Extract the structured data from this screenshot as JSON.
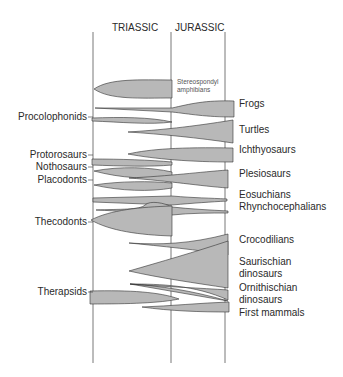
{
  "periods": [
    {
      "label": "TRIASSIC",
      "x": 112
    },
    {
      "label": "JURASSIC",
      "x": 175
    }
  ],
  "timelines": [
    93,
    171,
    225
  ],
  "colors": {
    "fill": "#b8b8b8",
    "stroke": "#333333",
    "line": "#555555"
  },
  "left_labels": [
    {
      "label": "Procolophonids",
      "y": 117
    },
    {
      "label": "Protorosaurs",
      "y": 155
    },
    {
      "label": "Nothosaurs",
      "y": 167
    },
    {
      "label": "Placodonts",
      "y": 180
    },
    {
      "label": "Thecodonts",
      "y": 222
    },
    {
      "label": "Therapsids",
      "y": 292
    }
  ],
  "right_labels": [
    {
      "label": "Frogs",
      "y": 104
    },
    {
      "label": "Turtles",
      "y": 130
    },
    {
      "label": "Ichthyosaurs",
      "y": 150
    },
    {
      "label": "Plesiosaurs",
      "y": 174
    },
    {
      "label": "Eosuchians",
      "y": 195
    },
    {
      "label": "Rhynchocephalians",
      "y": 207
    },
    {
      "label": "Crocodilians",
      "y": 240
    },
    {
      "label": "Saurischian",
      "y": 262
    },
    {
      "label": "dinosaurs",
      "y": 274
    },
    {
      "label": "Ornithischian",
      "y": 288
    },
    {
      "label": "dinosaurs",
      "y": 300
    },
    {
      "label": "First mammals",
      "y": 313
    }
  ],
  "inner_label": {
    "line1": "Stereospondyl",
    "line2": "amphibians"
  },
  "lineages": [
    {
      "name": "Stereospondyl amphibians",
      "d": "M94,89 C110,78 140,80 172,80 L172,98 C140,98 110,100 94,89 Z"
    },
    {
      "name": "Frogs",
      "d": "M95,108 L172,108 C190,104 205,100 234,101 L234,117 C205,117 190,114 172,112 L95,108 Z"
    },
    {
      "name": "Procolophonids",
      "d": "M92,118 C120,117 150,117 172,122 C150,125 120,122 92,121 Z"
    },
    {
      "name": "Turtles",
      "d": "M128,132 C160,130 190,127 233,120 L233,143 C200,138 160,134 128,132 Z"
    },
    {
      "name": "Ichthyosaurs",
      "d": "M128,154 C150,149 180,147 233,148 L233,162 C190,162 155,159 128,154 Z"
    },
    {
      "name": "Protorosaurs",
      "d": "M92,159 C120,159 150,160 172,162 L172,165 C150,167 120,166 92,165 Z"
    },
    {
      "name": "Nothosaurs",
      "d": "M94,171 C120,166 150,167 172,172 L172,176 C150,180 120,178 94,171 Z"
    },
    {
      "name": "Plesiosaurs",
      "d": "M129,178 C170,176 200,172 228,170 L228,188 C200,186 170,181 129,178 Z"
    },
    {
      "name": "Placodonts",
      "d": "M94,185 C120,181 150,181 172,183 L172,188 C150,192 120,191 94,185 Z"
    },
    {
      "name": "Eosuchians",
      "d": "M93,198 L172,196 C195,198 210,198 227,199 L227,201 C210,202 195,203 172,205 L93,202 Z"
    },
    {
      "name": "Rhynchocephalians",
      "d": "M96,210 C120,209 140,210 145,205 C150,200 165,203 172,207 C190,209 210,210 228,211 L228,213 C210,213 190,213 172,215 C160,219 150,221 145,217 C135,212 120,211 96,210 Z"
    },
    {
      "name": "Thecodonts",
      "d": "M91,220 C110,210 140,207 172,206 L172,236 C140,235 110,231 91,220 Z"
    },
    {
      "name": "Crocodilians",
      "d": "M129,243 C160,245 190,244 228,234 L228,255 C200,250 160,246 129,243 Z"
    },
    {
      "name": "Saurischian dinosaurs",
      "d": "M129,271 C160,262 195,252 228,241 L228,288 C195,283 160,278 129,271 Z"
    },
    {
      "name": "Ornithischian dinosaurs",
      "d": "M130,284 C160,284 195,285 228,300 L228,290 C200,288 170,287 130,284 Z M130,284 C160,286 190,290 228,301 L228,301 Z"
    },
    {
      "name": "Therapsids",
      "d": "M90,291 C130,290 160,292 179,299 C160,303 130,304 90,304 Z"
    },
    {
      "name": "First mammals",
      "d": "M142,307 C170,306 200,303 229,302 L229,312 C200,312 170,311 142,307 Z"
    }
  ]
}
